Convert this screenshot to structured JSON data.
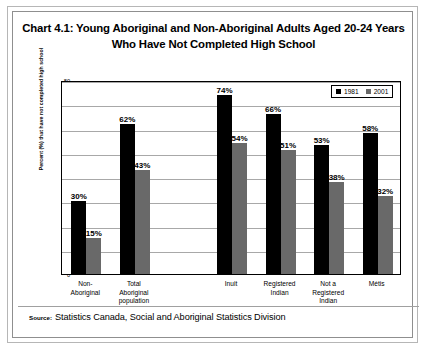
{
  "figure": {
    "title": "Chart 4.1: Young Aboriginal and Non-Aboriginal Adults Aged 20-24 Years Who Have Not Completed High School",
    "source_label": "Source:",
    "source_text": "Statistics Canada, Social and Aboriginal Statistics Division"
  },
  "colors": {
    "series_1981": "#000000",
    "series_2001": "#696969",
    "gridline": "#a8a8a8",
    "axis": "#000000",
    "frame_outer": "#b6b6b6",
    "frame_inner": "#8f8f8f",
    "background": "#ffffff"
  },
  "legend": {
    "position": "top-right",
    "entries": [
      {
        "label": "1981",
        "color": "#000000"
      },
      {
        "label": "2001",
        "color": "#696969"
      }
    ]
  },
  "chart_data": {
    "type": "bar",
    "title": "Chart 4.1: Young Aboriginal and Non-Aboriginal Adults Aged 20-24 Years Who Have Not Completed High School",
    "xlabel": "",
    "ylabel": "Percent (%) that have not completed high school",
    "ylim": [
      0,
      80
    ],
    "yticks": [
      0,
      10,
      20,
      30,
      40,
      50,
      60,
      70,
      80
    ],
    "ytick_labels": [
      "0",
      "10",
      "20",
      "30",
      "40",
      "50",
      "60",
      "70",
      "80"
    ],
    "grid": true,
    "grid_axis": "y",
    "categories": [
      "Non-\nAboriginal",
      "Total\nAboriginal\npopulation",
      "",
      "Inuit",
      "Registered\nIndian",
      "Not a\nRegistered\nIndian",
      "Métis"
    ],
    "series": [
      {
        "name": "1981",
        "color": "#000000",
        "values": [
          30,
          62,
          null,
          74,
          66,
          53,
          58
        ],
        "labels": [
          "30%",
          "62%",
          "",
          "74%",
          "66%",
          "53%",
          "58%"
        ]
      },
      {
        "name": "2001",
        "color": "#696969",
        "values": [
          15,
          43,
          null,
          54,
          51,
          38,
          32
        ],
        "labels": [
          "15%",
          "43%",
          "",
          "54%",
          "51%",
          "38%",
          "32%"
        ]
      }
    ]
  }
}
